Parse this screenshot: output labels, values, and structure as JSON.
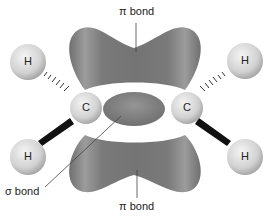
{
  "labels": {
    "pi_top": "π bond",
    "pi_bottom": "π bond",
    "sigma": "σ bond"
  },
  "atoms": {
    "h_top_left": "H",
    "h_top_right": "H",
    "c_left": "C",
    "c_right": "C",
    "h_bottom_left": "H",
    "h_bottom_right": "H"
  },
  "colors": {
    "lobe": "#7a7a7a",
    "lobe_light": "#a8a8a8",
    "atom": "#d6d6d6",
    "atom_light": "#f2f2f2"
  }
}
